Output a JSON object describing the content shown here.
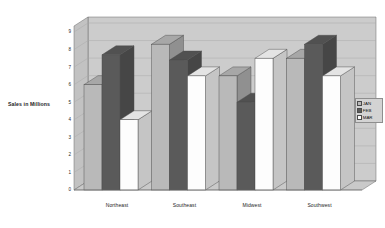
{
  "chart_data": {
    "type": "bar",
    "title": "",
    "subtitle": "",
    "xlabel": "",
    "ylabel": "Sales in Millions",
    "ylim": [
      0,
      9
    ],
    "ytick_labels": [
      "0",
      "1",
      "2",
      "3",
      "4",
      "5",
      "6",
      "7",
      "8",
      "9"
    ],
    "yticks": [
      0,
      1,
      2,
      3,
      4,
      5,
      6,
      7,
      8,
      9
    ],
    "grid": true,
    "grid_axis": "y",
    "style": "3d-clustered-column",
    "legend_position": "right",
    "categories": [
      "Northeast",
      "Southeast",
      "Midwest",
      "Southwest"
    ],
    "series": [
      {
        "name": "JAN",
        "color": "#b9b9b9",
        "values": [
          6.0,
          8.3,
          6.5,
          7.5
        ]
      },
      {
        "name": "FEB",
        "color": "#5a5a5a",
        "values": [
          7.7,
          7.4,
          5.0,
          8.3
        ]
      },
      {
        "name": "MAR",
        "color": "#fdfdfd",
        "values": [
          4.0,
          6.5,
          7.5,
          6.5
        ]
      }
    ]
  },
  "legend": {
    "items": [
      {
        "label": "JAN",
        "swatch": "#b9b9b9"
      },
      {
        "label": "FEB",
        "swatch": "#5a5a5a"
      },
      {
        "label": "MAR",
        "swatch": "#fdfdfd"
      }
    ]
  },
  "axes": {
    "y_title": "Sales in Millions"
  },
  "colors": {
    "plot_floor": "#c9c9c9",
    "plot_back_wall": "#cccccc",
    "plot_side_wall": "#c2c2c2",
    "gridline": "#a8a8a8",
    "outline": "#6b6b6b",
    "background": "#ffffff"
  }
}
